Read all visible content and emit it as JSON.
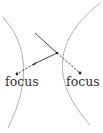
{
  "diagram": {
    "type": "hyperbola-reflection",
    "labels": {
      "left_focus": "focus",
      "right_focus": "focus"
    },
    "colors": {
      "curve": "#a8a8a8",
      "ray": "#333333",
      "focus_dot": "#222222",
      "text": "#333333",
      "background": "#ffffff"
    },
    "points": {
      "left_focus": [
        17,
        74
      ],
      "right_focus": [
        80,
        73
      ],
      "reflection_point": [
        57,
        53
      ],
      "incoming_ray_start": [
        35,
        33
      ]
    }
  }
}
